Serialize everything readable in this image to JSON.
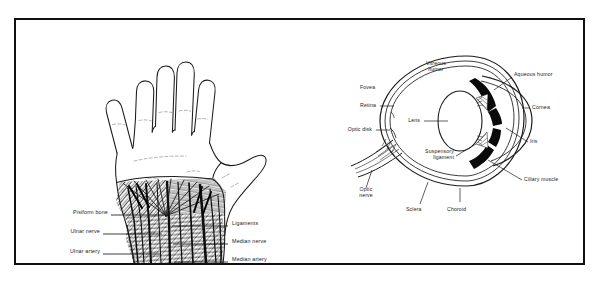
{
  "figure": {
    "background_color": "#ffffff",
    "frame_color": "#111111",
    "ink_color": "#1b1b1b"
  },
  "panels": [
    {
      "id": "hand-anatomy",
      "name": "Dissected palm and wrist",
      "labels_left": [
        {
          "text": "Pisiform bone",
          "name": "label-pisiform-bone"
        },
        {
          "text": "Ulnar nerve",
          "name": "label-ulnar-nerve"
        },
        {
          "text": "Ulnar artery",
          "name": "label-ulnar-artery"
        }
      ],
      "labels_right": [
        {
          "text": "Ligaments",
          "name": "label-ligaments"
        },
        {
          "text": "Median nerve",
          "name": "label-median-nerve"
        },
        {
          "text": "Median artery",
          "name": "label-median-artery"
        }
      ]
    },
    {
      "id": "eye-anatomy",
      "name": "Cross-section of the human eye",
      "labels": [
        {
          "text": "Vitreous humor",
          "name": "label-vitreous-humor"
        },
        {
          "text": "Aqueous humor",
          "name": "label-aqueous-humor"
        },
        {
          "text": "Fovea",
          "name": "label-fovea"
        },
        {
          "text": "Retina",
          "name": "label-retina"
        },
        {
          "text": "Lens",
          "name": "label-lens"
        },
        {
          "text": "Cornea",
          "name": "label-cornea"
        },
        {
          "text": "Optic disk",
          "name": "label-optic-disk"
        },
        {
          "text": "Iris",
          "name": "label-iris"
        },
        {
          "text": "Suspensory ligament",
          "name": "label-suspensory-ligament"
        },
        {
          "text": "Ciliary muscle",
          "name": "label-ciliary-muscle"
        },
        {
          "text": "Optic nerve",
          "name": "label-optic-nerve"
        },
        {
          "text": "Sclera",
          "name": "label-sclera"
        },
        {
          "text": "Choroid",
          "name": "label-choroid"
        }
      ]
    }
  ],
  "eye_labels": {
    "vitreous_humor_l1": "Vitreous",
    "vitreous_humor_l2": "humor",
    "aqueous_humor": "Aqueous humor",
    "fovea": "Fovea",
    "retina": "Retina",
    "lens": "Lens",
    "cornea": "Cornea",
    "optic_disk": "Optic disk",
    "iris": "Iris",
    "suspensory_l1": "Suspensory",
    "suspensory_l2": "ligament",
    "ciliary_muscle": "Ciliary muscle",
    "optic_nerve_l1": "Optic",
    "optic_nerve_l2": "nerve",
    "sclera": "Sclera",
    "choroid": "Choroid"
  },
  "hand_labels": {
    "pisiform_bone": "Pisiform bone",
    "ulnar_nerve": "Ulnar nerve",
    "ulnar_artery": "Ulnar artery",
    "ligaments": "Ligaments",
    "median_nerve": "Median nerve",
    "median_artery": "Median artery"
  }
}
